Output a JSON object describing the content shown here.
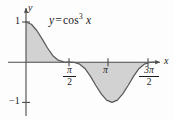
{
  "figure": {
    "background_color": "#fdfdfd",
    "axis_color": "#4a4a4a",
    "curve_color": "#555555",
    "fill_color": "#d2d2d2",
    "text_color": "#1a1a1a"
  },
  "labels": {
    "curve_equation": {
      "lhs": "y",
      "equals": "=",
      "function": "cos",
      "exponent": "3",
      "argument": "x",
      "full_text": "y = cos³ x"
    },
    "y_axis": "y",
    "x_axis": "x"
  },
  "ticks": {
    "y": [
      {
        "value": 1,
        "label": "1"
      },
      {
        "value": -1,
        "label": "-1",
        "display": "−1"
      }
    ],
    "x": [
      {
        "value": 1.5708,
        "label": "π/2",
        "numerator": "π",
        "denominator": "2"
      },
      {
        "value": 3.14159,
        "label": "π",
        "numerator": "π",
        "denominator": ""
      },
      {
        "value": 4.71239,
        "label": "3π/2",
        "numerator": "3π",
        "denominator": "2"
      }
    ]
  },
  "chart_data": {
    "type": "line",
    "title": "",
    "subtitle": "",
    "xlabel": "x",
    "ylabel": "y",
    "expression": "y = cos^3 x",
    "xlim": [
      0,
      4.71238898038469
    ],
    "ylim": [
      -1,
      1
    ],
    "grid": false,
    "legend": "none",
    "annotations": [
      "y = cos³ x"
    ],
    "xtick_values": [
      1.5707963,
      3.1415927,
      4.712389
    ],
    "xtick_labels": [
      "π/2",
      "π",
      "3π/2"
    ],
    "ytick_values": [
      1,
      -1
    ],
    "ytick_labels": [
      "1",
      "−1"
    ],
    "shaded_region": {
      "between": "curve and x-axis",
      "from_x": 0,
      "to_x": 4.71238898038469,
      "fill": "#d2d2d2"
    },
    "series": [
      {
        "name": "y = cos^3 x",
        "x": [
          0,
          0.1963,
          0.3927,
          0.589,
          0.7854,
          0.9817,
          1.178,
          1.3744,
          1.5708,
          1.7671,
          1.9635,
          2.1598,
          2.3562,
          2.5525,
          2.7489,
          2.9452,
          3.1416,
          3.3379,
          3.5343,
          3.7306,
          3.927,
          4.1233,
          4.3197,
          4.516,
          4.7124
        ],
        "values": [
          1.0,
          0.9434,
          0.7891,
          0.5792,
          0.3536,
          0.1616,
          0.0498,
          0.0073,
          0.0,
          -0.0073,
          -0.0498,
          -0.1616,
          -0.3536,
          -0.5792,
          -0.7891,
          -0.9434,
          -1.0,
          -0.9434,
          -0.7891,
          -0.5792,
          -0.3536,
          -0.1616,
          -0.0498,
          -0.0073,
          0.0
        ]
      }
    ],
    "key_points": [
      {
        "x": 0,
        "y": 1,
        "note": "maximum at x = 0"
      },
      {
        "x": 1.5708,
        "y": 0,
        "note": "zero at x = pi/2"
      },
      {
        "x": 3.1416,
        "y": -1,
        "note": "minimum at x = pi"
      },
      {
        "x": 4.7124,
        "y": 0,
        "note": "zero at x = 3pi/2"
      }
    ]
  }
}
